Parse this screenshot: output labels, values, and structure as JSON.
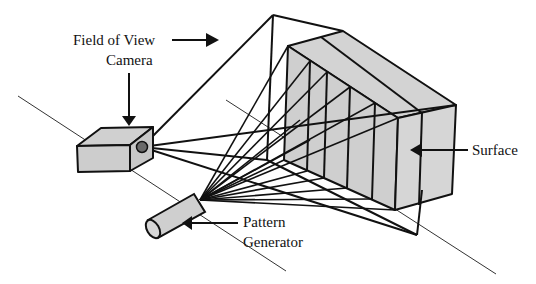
{
  "labels": {
    "field_of_view": "Field of View",
    "camera": "Camera",
    "surface": "Surface",
    "pattern_line1": "Pattern",
    "pattern_line2": "Generator"
  },
  "colors": {
    "fill_gray": "#cfcfcf",
    "stroke": "#111111",
    "lens": "#6a6a6a"
  },
  "diagram": {
    "components": [
      "camera",
      "pattern-generator",
      "surface",
      "field-of-view-pyramid",
      "projected-light-rays"
    ]
  }
}
